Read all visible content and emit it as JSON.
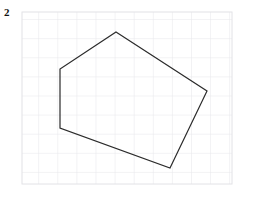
{
  "page": {
    "label": "2",
    "background_color": "#ffffff",
    "width": 258,
    "height": 197
  },
  "grid": {
    "line_color": "#e6e6ea",
    "line_width": 1,
    "cell_size": 19.1,
    "origin_x": 22,
    "origin_y": 12,
    "columns": 11,
    "rows": 9,
    "right": 232,
    "bottom": 184,
    "border_color": "#e2e2e6"
  },
  "chart_data": {
    "type": "scatter",
    "title": "",
    "xlabel": "",
    "ylabel": "",
    "grid": true,
    "legend": null,
    "xlim": [
      22,
      232
    ],
    "ylim": [
      12,
      184
    ],
    "shape": {
      "name": "pentagon",
      "closed": true,
      "stroke_color": "#2b2b2b",
      "stroke_width": 1.2,
      "fill": "none",
      "vertex_count": 5,
      "vertices": [
        {
          "label": "top",
          "x": 116,
          "y": 32
        },
        {
          "label": "right",
          "x": 207,
          "y": 91
        },
        {
          "label": "bottom",
          "x": 170,
          "y": 168
        },
        {
          "label": "bottom-left",
          "x": 60,
          "y": 128
        },
        {
          "label": "upper-left",
          "x": 60,
          "y": 69
        }
      ],
      "points_string": "116,32 207,91 170,168 60,128 60,69"
    }
  }
}
